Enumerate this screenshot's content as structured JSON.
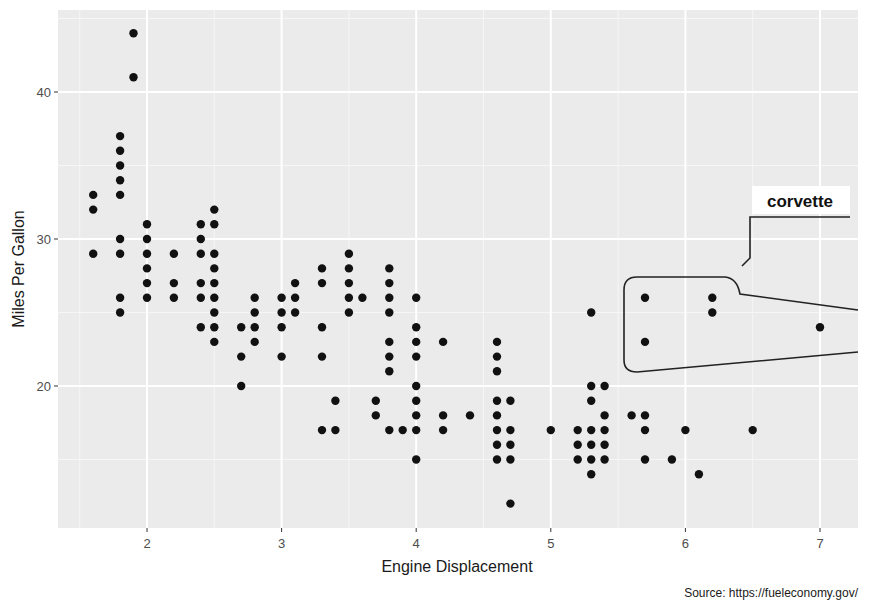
{
  "chart_data": {
    "type": "scatter",
    "title": "",
    "xlabel": "Engine Displacement",
    "ylabel": "Miles Per Gallon",
    "caption": "Source: https://fueleconomy.gov/",
    "xlim": [
      1.33,
      7.28
    ],
    "ylim": [
      10.4,
      45.5
    ],
    "xticks": [
      2,
      3,
      4,
      5,
      6,
      7
    ],
    "yticks": [
      20,
      30,
      40
    ],
    "grid": true,
    "legend": null,
    "annotation": {
      "label": "corvette",
      "highlighted_points": [
        [
          5.7,
          26
        ],
        [
          5.7,
          23
        ],
        [
          6.2,
          26
        ],
        [
          6.2,
          25
        ],
        [
          7.0,
          24
        ]
      ]
    },
    "points": [
      [
        1.6,
        33
      ],
      [
        1.6,
        32
      ],
      [
        1.6,
        29
      ],
      [
        1.8,
        37
      ],
      [
        1.8,
        36
      ],
      [
        1.8,
        35
      ],
      [
        1.8,
        34
      ],
      [
        1.8,
        33
      ],
      [
        1.8,
        30
      ],
      [
        1.8,
        29
      ],
      [
        1.8,
        26
      ],
      [
        1.8,
        25
      ],
      [
        1.9,
        44
      ],
      [
        1.9,
        41
      ],
      [
        2.0,
        31
      ],
      [
        2.0,
        30
      ],
      [
        2.0,
        29
      ],
      [
        2.0,
        28
      ],
      [
        2.0,
        27
      ],
      [
        2.0,
        26
      ],
      [
        2.2,
        29
      ],
      [
        2.2,
        27
      ],
      [
        2.2,
        26
      ],
      [
        2.4,
        31
      ],
      [
        2.4,
        30
      ],
      [
        2.4,
        29
      ],
      [
        2.4,
        27
      ],
      [
        2.4,
        26
      ],
      [
        2.4,
        24
      ],
      [
        2.5,
        32
      ],
      [
        2.5,
        31
      ],
      [
        2.5,
        29
      ],
      [
        2.5,
        28
      ],
      [
        2.5,
        27
      ],
      [
        2.5,
        26
      ],
      [
        2.5,
        25
      ],
      [
        2.5,
        24
      ],
      [
        2.5,
        23
      ],
      [
        2.7,
        24
      ],
      [
        2.7,
        22
      ],
      [
        2.7,
        20
      ],
      [
        2.8,
        26
      ],
      [
        2.8,
        25
      ],
      [
        2.8,
        24
      ],
      [
        2.8,
        23
      ],
      [
        3.0,
        26
      ],
      [
        3.0,
        25
      ],
      [
        3.0,
        24
      ],
      [
        3.0,
        22
      ],
      [
        3.1,
        27
      ],
      [
        3.1,
        26
      ],
      [
        3.1,
        25
      ],
      [
        3.3,
        28
      ],
      [
        3.3,
        27
      ],
      [
        3.3,
        24
      ],
      [
        3.3,
        22
      ],
      [
        3.3,
        17
      ],
      [
        3.4,
        19
      ],
      [
        3.4,
        17
      ],
      [
        3.5,
        29
      ],
      [
        3.5,
        28
      ],
      [
        3.5,
        27
      ],
      [
        3.5,
        26
      ],
      [
        3.5,
        25
      ],
      [
        3.6,
        26
      ],
      [
        3.7,
        19
      ],
      [
        3.7,
        18
      ],
      [
        3.8,
        28
      ],
      [
        3.8,
        27
      ],
      [
        3.8,
        26
      ],
      [
        3.8,
        25
      ],
      [
        3.8,
        23
      ],
      [
        3.8,
        22
      ],
      [
        3.8,
        21
      ],
      [
        3.8,
        17
      ],
      [
        3.9,
        17
      ],
      [
        4.0,
        26
      ],
      [
        4.0,
        24
      ],
      [
        4.0,
        23
      ],
      [
        4.0,
        22
      ],
      [
        4.0,
        20
      ],
      [
        4.0,
        19
      ],
      [
        4.0,
        18
      ],
      [
        4.0,
        17
      ],
      [
        4.0,
        15
      ],
      [
        4.2,
        23
      ],
      [
        4.2,
        18
      ],
      [
        4.2,
        17
      ],
      [
        4.4,
        18
      ],
      [
        4.6,
        23
      ],
      [
        4.6,
        22
      ],
      [
        4.6,
        21
      ],
      [
        4.6,
        19
      ],
      [
        4.6,
        18
      ],
      [
        4.6,
        17
      ],
      [
        4.6,
        16
      ],
      [
        4.6,
        15
      ],
      [
        4.7,
        19
      ],
      [
        4.7,
        17
      ],
      [
        4.7,
        16
      ],
      [
        4.7,
        15
      ],
      [
        4.7,
        12
      ],
      [
        5.0,
        17
      ],
      [
        5.2,
        17
      ],
      [
        5.2,
        16
      ],
      [
        5.2,
        15
      ],
      [
        5.3,
        25
      ],
      [
        5.3,
        20
      ],
      [
        5.3,
        19
      ],
      [
        5.3,
        17
      ],
      [
        5.3,
        16
      ],
      [
        5.3,
        15
      ],
      [
        5.3,
        14
      ],
      [
        5.4,
        20
      ],
      [
        5.4,
        18
      ],
      [
        5.4,
        17
      ],
      [
        5.4,
        16
      ],
      [
        5.4,
        15
      ],
      [
        5.6,
        18
      ],
      [
        5.7,
        26
      ],
      [
        5.7,
        23
      ],
      [
        5.7,
        18
      ],
      [
        5.7,
        17
      ],
      [
        5.7,
        15
      ],
      [
        5.9,
        15
      ],
      [
        6.0,
        17
      ],
      [
        6.1,
        14
      ],
      [
        6.2,
        26
      ],
      [
        6.2,
        25
      ],
      [
        6.5,
        17
      ],
      [
        7.0,
        24
      ]
    ]
  }
}
